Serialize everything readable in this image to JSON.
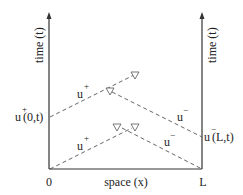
{
  "diagram": {
    "type": "space-time characteristic diagram",
    "x_axis": {
      "label": "space (x)",
      "start_label": "0",
      "end_label": "L"
    },
    "left_axis": {
      "label": "time (t)"
    },
    "right_axis": {
      "label": "time (t)"
    },
    "boundary_labels": {
      "left": {
        "base": "u",
        "sup": "+",
        "args": "(0,t)"
      },
      "right": {
        "base": "u",
        "sup": "−",
        "args": "(L,t)"
      }
    },
    "wave_labels": [
      {
        "base": "u",
        "sup": "+",
        "position": "upper-left"
      },
      {
        "base": "u",
        "sup": "−",
        "position": "upper-right"
      },
      {
        "base": "u",
        "sup": "+",
        "position": "lower-left"
      },
      {
        "base": "u",
        "sup": "−",
        "position": "lower-right"
      }
    ],
    "colors": {
      "axis": "#333333",
      "dashed_line": "#555555",
      "text": "#222222",
      "background": "#ffffff"
    }
  }
}
